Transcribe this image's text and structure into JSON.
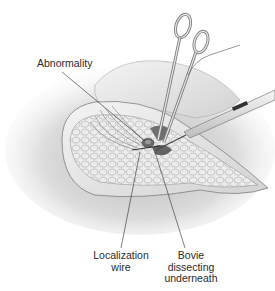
{
  "figure": {
    "colors": {
      "background": "#ffffff",
      "shadow": "#c8c8c8",
      "tissue": "#e6e6e6",
      "tissue_line": "#8a8a8a",
      "instrument": "#d9d9d9",
      "instrument_edge": "#6e6e6e",
      "leader": "#2a2a2a",
      "lesion": "#555555"
    },
    "labels": [
      {
        "id": "abnormality",
        "lines": [
          "Abnormality"
        ]
      },
      {
        "id": "localization-wire",
        "lines": [
          "Localization",
          "wire"
        ]
      },
      {
        "id": "bovie",
        "lines": [
          "Bovie",
          "dissecting",
          "underneath"
        ]
      }
    ],
    "instruments": [
      {
        "name": "hemostat-clamp",
        "icon": "clamp-icon"
      },
      {
        "name": "bovie-electrocautery-pen",
        "icon": "cautery-pen-icon"
      },
      {
        "name": "localization-wire",
        "icon": "wire-icon"
      }
    ]
  }
}
